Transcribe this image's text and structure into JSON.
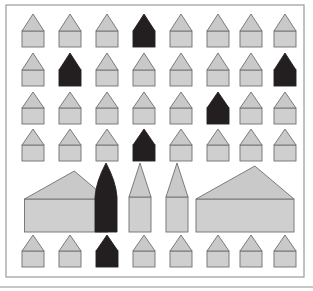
{
  "figure": {
    "background_color": "#ffffff",
    "frame": {
      "name": "outer-frame",
      "x": 6,
      "y": 5,
      "width": 298,
      "height": 272,
      "stroke": "#9a9a9a",
      "stroke_width": 1.2,
      "fill": "#ffffff"
    },
    "baseline_rule": {
      "name": "bottom-rule",
      "x1": 0,
      "y1": 287,
      "x2": 313,
      "y2": 287,
      "stroke": "#8f8f8f",
      "stroke_width": 1
    },
    "palette": {
      "light_fill": "#cfcfcf",
      "light_roof_fill": "#c9c9c9",
      "dark_fill": "#231f20",
      "outline": "#6f6f6f",
      "outline_width": 0.9
    },
    "legend": {
      "light_label": "light house",
      "dark_label": "dark house"
    }
  },
  "chart_data": {
    "type": "pictogram-grid",
    "xlabel": "",
    "ylabel": "",
    "columns": 8,
    "rows": 6,
    "color_values": {
      "light": "#cfcfcf",
      "dark": "#231f20"
    },
    "row_labels": [
      "row-1",
      "row-2",
      "row-3",
      "row-4",
      "row-5",
      "row-6"
    ],
    "dark_counts_per_row": [
      1,
      2,
      1,
      1,
      1,
      1
    ],
    "total_shapes": 45,
    "total_dark": 7,
    "total_light": 38,
    "rows_data": [
      {
        "row": 1,
        "kind": "small-house-row",
        "y_base": 47,
        "shapes": [
          {
            "id": "r1c1",
            "type": "house",
            "tone": "light",
            "cx": 33,
            "body_w": 22,
            "body_h": 16,
            "roof_h": 17
          },
          {
            "id": "r1c2",
            "type": "house",
            "tone": "light",
            "cx": 70,
            "body_w": 22,
            "body_h": 16,
            "roof_h": 17
          },
          {
            "id": "r1c3",
            "type": "house",
            "tone": "light",
            "cx": 107,
            "body_w": 22,
            "body_h": 16,
            "roof_h": 17
          },
          {
            "id": "r1c4",
            "type": "house",
            "tone": "dark",
            "cx": 144,
            "body_w": 22,
            "body_h": 16,
            "roof_h": 17
          },
          {
            "id": "r1c5",
            "type": "house",
            "tone": "light",
            "cx": 181,
            "body_w": 22,
            "body_h": 16,
            "roof_h": 17
          },
          {
            "id": "r1c6",
            "type": "house",
            "tone": "light",
            "cx": 218,
            "body_w": 22,
            "body_h": 16,
            "roof_h": 17
          },
          {
            "id": "r1c7",
            "type": "house",
            "tone": "light",
            "cx": 251,
            "body_w": 22,
            "body_h": 16,
            "roof_h": 17
          },
          {
            "id": "r1c8",
            "type": "house",
            "tone": "light",
            "cx": 285,
            "body_w": 22,
            "body_h": 16,
            "roof_h": 17
          }
        ]
      },
      {
        "row": 2,
        "kind": "small-house-row",
        "y_base": 86,
        "shapes": [
          {
            "id": "r2c1",
            "type": "house",
            "tone": "light",
            "cx": 33,
            "body_w": 22,
            "body_h": 16,
            "roof_h": 17
          },
          {
            "id": "r2c2",
            "type": "house",
            "tone": "dark",
            "cx": 70,
            "body_w": 22,
            "body_h": 16,
            "roof_h": 17
          },
          {
            "id": "r2c3",
            "type": "house",
            "tone": "light",
            "cx": 107,
            "body_w": 22,
            "body_h": 16,
            "roof_h": 17
          },
          {
            "id": "r2c4",
            "type": "house",
            "tone": "light",
            "cx": 144,
            "body_w": 22,
            "body_h": 16,
            "roof_h": 17
          },
          {
            "id": "r2c5",
            "type": "house",
            "tone": "light",
            "cx": 181,
            "body_w": 22,
            "body_h": 16,
            "roof_h": 17
          },
          {
            "id": "r2c6",
            "type": "house",
            "tone": "light",
            "cx": 218,
            "body_w": 22,
            "body_h": 16,
            "roof_h": 17
          },
          {
            "id": "r2c7",
            "type": "house",
            "tone": "light",
            "cx": 251,
            "body_w": 22,
            "body_h": 16,
            "roof_h": 17
          },
          {
            "id": "r2c8",
            "type": "house",
            "tone": "dark",
            "cx": 285,
            "body_w": 22,
            "body_h": 16,
            "roof_h": 17
          }
        ]
      },
      {
        "row": 3,
        "kind": "small-house-row",
        "y_base": 124,
        "shapes": [
          {
            "id": "r3c1",
            "type": "house",
            "tone": "light",
            "cx": 33,
            "body_w": 22,
            "body_h": 16,
            "roof_h": 16
          },
          {
            "id": "r3c2",
            "type": "house",
            "tone": "light",
            "cx": 70,
            "body_w": 22,
            "body_h": 16,
            "roof_h": 16
          },
          {
            "id": "r3c3",
            "type": "house",
            "tone": "light",
            "cx": 107,
            "body_w": 22,
            "body_h": 16,
            "roof_h": 16
          },
          {
            "id": "r3c4",
            "type": "house",
            "tone": "light",
            "cx": 144,
            "body_w": 22,
            "body_h": 16,
            "roof_h": 16
          },
          {
            "id": "r3c5",
            "type": "house",
            "tone": "light",
            "cx": 181,
            "body_w": 22,
            "body_h": 16,
            "roof_h": 16
          },
          {
            "id": "r3c6",
            "type": "house",
            "tone": "dark",
            "cx": 218,
            "body_w": 22,
            "body_h": 16,
            "roof_h": 16
          },
          {
            "id": "r3c7",
            "type": "house",
            "tone": "light",
            "cx": 251,
            "body_w": 22,
            "body_h": 16,
            "roof_h": 16
          },
          {
            "id": "r3c8",
            "type": "house",
            "tone": "light",
            "cx": 285,
            "body_w": 22,
            "body_h": 16,
            "roof_h": 16
          }
        ]
      },
      {
        "row": 4,
        "kind": "small-house-row",
        "y_base": 161,
        "shapes": [
          {
            "id": "r4c1",
            "type": "house",
            "tone": "light",
            "cx": 33,
            "body_w": 22,
            "body_h": 16,
            "roof_h": 16
          },
          {
            "id": "r4c2",
            "type": "house",
            "tone": "light",
            "cx": 70,
            "body_w": 22,
            "body_h": 16,
            "roof_h": 16
          },
          {
            "id": "r4c3",
            "type": "house",
            "tone": "light",
            "cx": 107,
            "body_w": 22,
            "body_h": 16,
            "roof_h": 16
          },
          {
            "id": "r4c4",
            "type": "house",
            "tone": "dark",
            "cx": 144,
            "body_w": 22,
            "body_h": 16,
            "roof_h": 16
          },
          {
            "id": "r4c5",
            "type": "house",
            "tone": "light",
            "cx": 181,
            "body_w": 22,
            "body_h": 16,
            "roof_h": 16
          },
          {
            "id": "r4c6",
            "type": "house",
            "tone": "light",
            "cx": 218,
            "body_w": 22,
            "body_h": 16,
            "roof_h": 16
          },
          {
            "id": "r4c7",
            "type": "house",
            "tone": "light",
            "cx": 251,
            "body_w": 22,
            "body_h": 16,
            "roof_h": 16
          },
          {
            "id": "r4c8",
            "type": "house",
            "tone": "light",
            "cx": 285,
            "body_w": 22,
            "body_h": 16,
            "roof_h": 16
          }
        ]
      },
      {
        "row": 5,
        "kind": "large-building-row",
        "y_base": 232,
        "shapes": [
          {
            "id": "r5b1",
            "type": "wide-house",
            "tone": "light",
            "cx": 66,
            "body_w": 83,
            "body_h": 33,
            "roof_h": 28
          },
          {
            "id": "r5b2",
            "type": "spire-tower",
            "tone": "dark",
            "cx": 106,
            "body_w": 22,
            "body_h": 35,
            "roof_h": 34
          },
          {
            "id": "r5b3",
            "type": "spire-tower",
            "tone": "light",
            "cx": 140,
            "body_w": 22,
            "body_h": 35,
            "roof_h": 34
          },
          {
            "id": "r5b4",
            "type": "spire-tower",
            "tone": "light",
            "cx": 177,
            "body_w": 22,
            "body_h": 35,
            "roof_h": 34
          },
          {
            "id": "r5b5",
            "type": "wide-house",
            "tone": "light",
            "cx": 245,
            "body_w": 98,
            "body_h": 33,
            "roof_h": 33
          }
        ]
      },
      {
        "row": 6,
        "kind": "small-house-row",
        "y_base": 267,
        "shapes": [
          {
            "id": "r6c1",
            "type": "house",
            "tone": "light",
            "cx": 33,
            "body_w": 22,
            "body_h": 16,
            "roof_h": 16
          },
          {
            "id": "r6c2",
            "type": "house",
            "tone": "light",
            "cx": 70,
            "body_w": 22,
            "body_h": 16,
            "roof_h": 16
          },
          {
            "id": "r6c3",
            "type": "house",
            "tone": "dark",
            "cx": 107,
            "body_w": 22,
            "body_h": 16,
            "roof_h": 16
          },
          {
            "id": "r6c4",
            "type": "house",
            "tone": "light",
            "cx": 144,
            "body_w": 22,
            "body_h": 16,
            "roof_h": 16
          },
          {
            "id": "r6c5",
            "type": "house",
            "tone": "light",
            "cx": 181,
            "body_w": 22,
            "body_h": 16,
            "roof_h": 16
          },
          {
            "id": "r6c6",
            "type": "house",
            "tone": "light",
            "cx": 218,
            "body_w": 22,
            "body_h": 16,
            "roof_h": 16
          },
          {
            "id": "r6c7",
            "type": "house",
            "tone": "light",
            "cx": 251,
            "body_w": 22,
            "body_h": 16,
            "roof_h": 16
          },
          {
            "id": "r6c8",
            "type": "house",
            "tone": "light",
            "cx": 285,
            "body_w": 22,
            "body_h": 16,
            "roof_h": 16
          }
        ]
      }
    ]
  }
}
